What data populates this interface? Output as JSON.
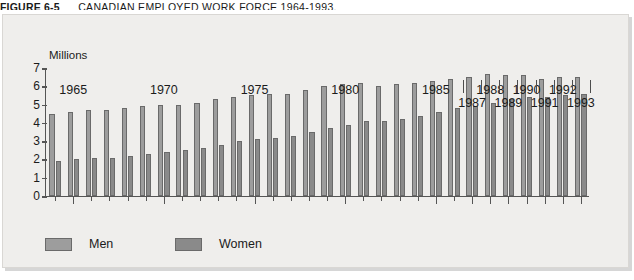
{
  "caption": {
    "number": "FIGURE 6-5",
    "text": "CANADIAN EMPLOYED WORK FORCE 1964-1993."
  },
  "chart_data": {
    "type": "bar",
    "title": "CANADIAN EMPLOYED WORK FORCE 1964-1993.",
    "ylabel": "Millions",
    "xlabel": "",
    "ylim": [
      0,
      7
    ],
    "yticks": [
      0,
      1,
      2,
      3,
      4,
      5,
      6,
      7
    ],
    "grid": false,
    "legend_position": "bottom-left",
    "categories": [
      "1964",
      "1965",
      "1966",
      "1967",
      "1968",
      "1969",
      "1970",
      "1971",
      "1972",
      "1973",
      "1974",
      "1975",
      "1976",
      "1977",
      "1978",
      "1979",
      "1980",
      "1981",
      "1982",
      "1983",
      "1984",
      "1985",
      "1986",
      "1987",
      "1988",
      "1989",
      "1990",
      "1991",
      "1992",
      "1993"
    ],
    "xtick_labels_row1": [
      "1965",
      "1970",
      "1975",
      "1980",
      "1985",
      "1988",
      "1990",
      "1992"
    ],
    "xtick_labels_row2": [
      "1987",
      "1989",
      "1991",
      "1993"
    ],
    "series": [
      {
        "name": "Men",
        "color": "#9d9d9d",
        "values": [
          4.5,
          4.6,
          4.7,
          4.7,
          4.8,
          4.9,
          5.0,
          5.0,
          5.1,
          5.3,
          5.4,
          5.5,
          5.6,
          5.6,
          5.8,
          6.0,
          6.1,
          6.2,
          6.0,
          6.1,
          6.2,
          6.3,
          6.4,
          6.5,
          6.7,
          6.6,
          6.6,
          6.4,
          6.5,
          6.5
        ]
      },
      {
        "name": "Women",
        "color": "#8a8a8a",
        "values": [
          1.9,
          2.0,
          2.1,
          2.1,
          2.2,
          2.3,
          2.4,
          2.5,
          2.6,
          2.8,
          3.0,
          3.1,
          3.2,
          3.3,
          3.5,
          3.7,
          3.9,
          4.1,
          4.1,
          4.2,
          4.4,
          4.6,
          4.8,
          4.9,
          5.1,
          5.3,
          5.4,
          5.4,
          5.5,
          5.6
        ]
      }
    ]
  },
  "legend": {
    "items": [
      {
        "label": "Men",
        "swatch": "men"
      },
      {
        "label": "Women",
        "swatch": "women"
      }
    ]
  }
}
